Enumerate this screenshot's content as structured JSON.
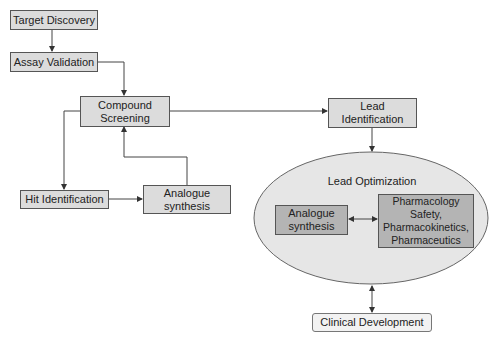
{
  "diagram": {
    "nodes": {
      "target_discovery": "Target Discovery",
      "assay_validation": "Assay Validation",
      "compound_screening": "Compound Screening",
      "lead_identification": "Lead Identification",
      "hit_identification": "Hit Identification",
      "analogue_synthesis": "Analogue synthesis",
      "lead_optimization": "Lead Optimization",
      "lo_analogue_synthesis": "Analogue synthesis",
      "lo_pharmacology": "Pharmacology Safety, Pharmacokinetics, Pharmaceutics",
      "clinical_development": "Clinical Development"
    },
    "edges": [
      {
        "from": "Target Discovery",
        "to": "Assay Validation"
      },
      {
        "from": "Assay Validation",
        "to": "Compound Screening"
      },
      {
        "from": "Compound Screening",
        "to": "Lead Identification"
      },
      {
        "from": "Compound Screening",
        "to": "Hit Identification"
      },
      {
        "from": "Hit Identification",
        "to": "Analogue synthesis"
      },
      {
        "from": "Analogue synthesis",
        "to": "Compound Screening"
      },
      {
        "from": "Lead Identification",
        "to": "Lead Optimization"
      },
      {
        "from": "Analogue synthesis (LO)",
        "to": "Pharmacology Safety, Pharmacokinetics, Pharmaceutics",
        "bidirectional": true
      },
      {
        "from": "Lead Optimization",
        "to": "Clinical Development",
        "bidirectional": true
      }
    ],
    "colors": {
      "box_fill": "#dcdcdc",
      "inner_box_fill": "#b4b4b4",
      "ellipse_fill": "#e6e6e6",
      "line": "#444444"
    }
  }
}
